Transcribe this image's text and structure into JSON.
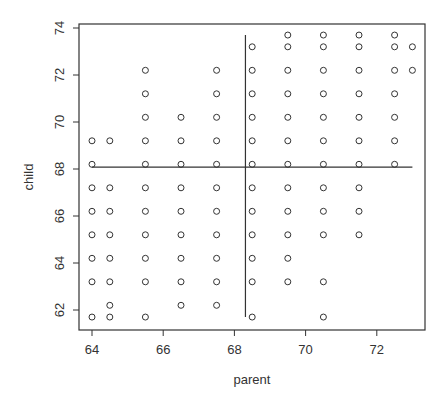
{
  "chart_data": {
    "type": "scatter",
    "title": "",
    "xlabel": "parent",
    "ylabel": "child",
    "xlim": [
      63.7,
      73.4
    ],
    "ylim": [
      61.3,
      74.3
    ],
    "x_ticks": [
      64,
      66,
      68,
      70,
      72
    ],
    "y_ticks": [
      62,
      64,
      66,
      68,
      70,
      72,
      74
    ],
    "grid": false,
    "legend": null,
    "marker": "open-circle",
    "reference_lines": {
      "horizontal": {
        "y": 68.08,
        "x_from": 64,
        "x_to": 73
      },
      "vertical": {
        "x": 68.31,
        "y_from": 61.7,
        "y_to": 73.7
      }
    },
    "points": [
      [
        64,
        61.7
      ],
      [
        64,
        63.2
      ],
      [
        64,
        64.2
      ],
      [
        64,
        65.2
      ],
      [
        64,
        66.2
      ],
      [
        64,
        67.2
      ],
      [
        64,
        68.2
      ],
      [
        64,
        69.2
      ],
      [
        64.5,
        61.7
      ],
      [
        64.5,
        62.2
      ],
      [
        64.5,
        63.2
      ],
      [
        64.5,
        64.2
      ],
      [
        64.5,
        65.2
      ],
      [
        64.5,
        66.2
      ],
      [
        64.5,
        67.2
      ],
      [
        64.5,
        69.2
      ],
      [
        65.5,
        61.7
      ],
      [
        65.5,
        63.2
      ],
      [
        65.5,
        64.2
      ],
      [
        65.5,
        65.2
      ],
      [
        65.5,
        66.2
      ],
      [
        65.5,
        67.2
      ],
      [
        65.5,
        68.2
      ],
      [
        65.5,
        69.2
      ],
      [
        65.5,
        70.2
      ],
      [
        65.5,
        71.2
      ],
      [
        65.5,
        72.2
      ],
      [
        66.5,
        62.2
      ],
      [
        66.5,
        63.2
      ],
      [
        66.5,
        64.2
      ],
      [
        66.5,
        65.2
      ],
      [
        66.5,
        66.2
      ],
      [
        66.5,
        67.2
      ],
      [
        66.5,
        68.2
      ],
      [
        66.5,
        69.2
      ],
      [
        66.5,
        70.2
      ],
      [
        67.5,
        62.2
      ],
      [
        67.5,
        63.2
      ],
      [
        67.5,
        64.2
      ],
      [
        67.5,
        65.2
      ],
      [
        67.5,
        66.2
      ],
      [
        67.5,
        67.2
      ],
      [
        67.5,
        68.2
      ],
      [
        67.5,
        69.2
      ],
      [
        67.5,
        70.2
      ],
      [
        67.5,
        71.2
      ],
      [
        67.5,
        72.2
      ],
      [
        68.5,
        61.7
      ],
      [
        68.5,
        63.2
      ],
      [
        68.5,
        64.2
      ],
      [
        68.5,
        65.2
      ],
      [
        68.5,
        66.2
      ],
      [
        68.5,
        67.2
      ],
      [
        68.5,
        68.2
      ],
      [
        68.5,
        69.2
      ],
      [
        68.5,
        70.2
      ],
      [
        68.5,
        71.2
      ],
      [
        68.5,
        72.2
      ],
      [
        68.5,
        73.2
      ],
      [
        69.5,
        63.2
      ],
      [
        69.5,
        64.2
      ],
      [
        69.5,
        65.2
      ],
      [
        69.5,
        66.2
      ],
      [
        69.5,
        67.2
      ],
      [
        69.5,
        68.2
      ],
      [
        69.5,
        69.2
      ],
      [
        69.5,
        70.2
      ],
      [
        69.5,
        71.2
      ],
      [
        69.5,
        72.2
      ],
      [
        69.5,
        73.2
      ],
      [
        69.5,
        73.7
      ],
      [
        70.5,
        61.7
      ],
      [
        70.5,
        63.2
      ],
      [
        70.5,
        65.2
      ],
      [
        70.5,
        66.2
      ],
      [
        70.5,
        67.2
      ],
      [
        70.5,
        68.2
      ],
      [
        70.5,
        69.2
      ],
      [
        70.5,
        70.2
      ],
      [
        70.5,
        71.2
      ],
      [
        70.5,
        72.2
      ],
      [
        70.5,
        73.2
      ],
      [
        70.5,
        73.7
      ],
      [
        71.5,
        65.2
      ],
      [
        71.5,
        66.2
      ],
      [
        71.5,
        67.2
      ],
      [
        71.5,
        68.2
      ],
      [
        71.5,
        69.2
      ],
      [
        71.5,
        70.2
      ],
      [
        71.5,
        71.2
      ],
      [
        71.5,
        72.2
      ],
      [
        71.5,
        73.2
      ],
      [
        71.5,
        73.7
      ],
      [
        72.5,
        68.2
      ],
      [
        72.5,
        69.2
      ],
      [
        72.5,
        70.2
      ],
      [
        72.5,
        71.2
      ],
      [
        72.5,
        72.2
      ],
      [
        72.5,
        73.2
      ],
      [
        72.5,
        73.7
      ],
      [
        73,
        72.2
      ],
      [
        73,
        73.2
      ]
    ]
  },
  "colors": {
    "axis": "#333333",
    "marker": "#333333",
    "background": "#ffffff"
  }
}
